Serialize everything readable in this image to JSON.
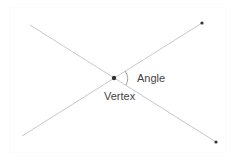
{
  "diagram": {
    "labels": {
      "angle": "Angle",
      "vertex": "Vertex"
    },
    "colors": {
      "line": "#c8c8c8",
      "point": "#333333",
      "text": "#444444",
      "arc": "#888888"
    },
    "vertex": {
      "x": 114,
      "y": 78
    },
    "lines": [
      {
        "name": "line-a",
        "from": {
          "x": 30,
          "y": 25
        },
        "to": {
          "x": 216,
          "y": 142
        }
      },
      {
        "name": "line-b",
        "from": {
          "x": 22,
          "y": 136
        },
        "to": {
          "x": 202,
          "y": 23
        }
      }
    ],
    "points": [
      {
        "name": "endpoint-top-right",
        "x": 202,
        "y": 23
      },
      {
        "name": "endpoint-bottom-right",
        "x": 216,
        "y": 142
      },
      {
        "name": "vertex-point",
        "x": 114,
        "y": 78
      }
    ]
  }
}
